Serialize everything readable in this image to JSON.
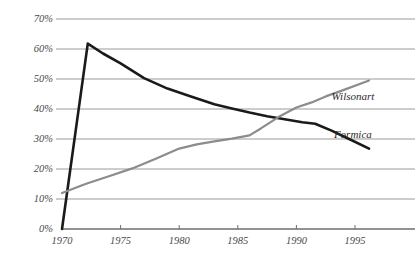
{
  "chart_data": {
    "type": "line",
    "title": "",
    "subtitle": "",
    "xlabel": "",
    "ylabel": "",
    "xlim": [
      1970,
      1996.5
    ],
    "ylim": [
      0,
      72
    ],
    "grid": true,
    "grid_axis": "y",
    "legend_position": "inline-right",
    "x_ticks": [
      1970,
      1975,
      1980,
      1985,
      1990,
      1995
    ],
    "x_tick_labels": [
      "1970",
      "1975",
      "1980",
      "1985",
      "1990",
      "1995"
    ],
    "y_ticks": [
      0,
      10,
      20,
      30,
      40,
      50,
      60,
      70
    ],
    "y_tick_labels": [
      "0%",
      "10%",
      "20%",
      "30%",
      "40%",
      "50%",
      "60%",
      "70%"
    ],
    "series": [
      {
        "name": "Formica",
        "color": "#1a1a1a",
        "line_width": 2.6,
        "label_x": 1993.2,
        "label_y": 31.5,
        "x": [
          1970,
          1972.2,
          1973.5,
          1975,
          1977,
          1979,
          1981,
          1983,
          1984.5,
          1986,
          1987.5,
          1989,
          1990.5,
          1991.6,
          1993,
          1994.5,
          1996.2
        ],
        "values": [
          0,
          61.8,
          58.5,
          55.2,
          50.3,
          46.8,
          44.2,
          41.6,
          40.2,
          38.8,
          37.6,
          36.6,
          35.6,
          35.1,
          32.8,
          30.0,
          26.8
        ]
      },
      {
        "name": "Wilsonart",
        "color": "#8c8c8c",
        "line_width": 2.2,
        "label_x": 1993.0,
        "label_y": 44.0,
        "x": [
          1970,
          1972,
          1974,
          1976,
          1978,
          1980,
          1981.5,
          1983,
          1984.5,
          1986,
          1987,
          1988.5,
          1990,
          1991.3,
          1992.5,
          1994,
          1996.2
        ],
        "values": [
          12.0,
          15.0,
          17.6,
          20.2,
          23.4,
          26.8,
          28.2,
          29.2,
          30.1,
          31.2,
          33.6,
          37.4,
          40.5,
          42.2,
          44.2,
          46.3,
          49.5
        ]
      }
    ]
  },
  "axes": {
    "y_axis_name": "percent-axis",
    "x_axis_name": "year-axis"
  },
  "colors": {
    "gridline": "#9a9a9a",
    "baseline": "#6e6e6e",
    "tick_label": "#4a4a4a",
    "series_formica": "#1a1a1a",
    "series_wilsonart": "#8c8c8c"
  }
}
